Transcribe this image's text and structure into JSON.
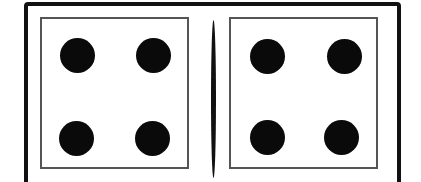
{
  "domino": {
    "left_half": {
      "pips": 4
    },
    "right_half": {
      "pips": 4
    },
    "colors": {
      "pip": "#0a0a0a",
      "border": "#111111",
      "inner_border": "#555555",
      "face": "#ffffff"
    }
  }
}
